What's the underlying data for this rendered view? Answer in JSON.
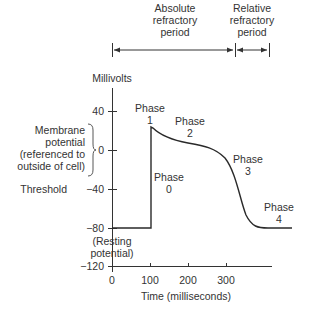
{
  "periods": {
    "absolute": {
      "line1": "Absolute",
      "line2": "refractory",
      "line3": "period"
    },
    "relative": {
      "line1": "Relative",
      "line2": "refractory",
      "line3": "period"
    }
  },
  "y_axis": {
    "title": "Millivolts",
    "ticks": [
      "40",
      "0",
      "−40",
      "−80",
      "−120"
    ],
    "tick_values": [
      40,
      0,
      -40,
      -80,
      -120
    ]
  },
  "x_axis": {
    "title": "Time (milliseconds)",
    "ticks": [
      "0",
      "100",
      "200",
      "300"
    ],
    "tick_values": [
      0,
      100,
      200,
      300
    ]
  },
  "annotations": {
    "membrane": {
      "line1": "Membrane",
      "line2": "potential",
      "line3": "(referenced to",
      "line4": "outside of cell)"
    },
    "threshold": "Threshold",
    "resting": {
      "line1": "(Resting",
      "line2": "potential)"
    }
  },
  "phases": [
    {
      "label": "Phase",
      "num": "0"
    },
    {
      "label": "Phase",
      "num": "1"
    },
    {
      "label": "Phase",
      "num": "2"
    },
    {
      "label": "Phase",
      "num": "3"
    },
    {
      "label": "Phase",
      "num": "4"
    }
  ],
  "curve_color": "#2a2a2a"
}
